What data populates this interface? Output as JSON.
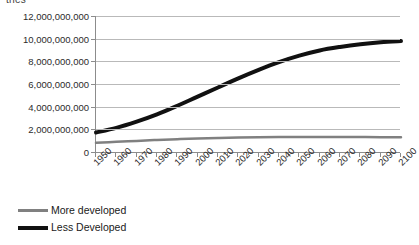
{
  "clipped_caption": "tries",
  "chart_data": {
    "type": "line",
    "title": "",
    "xlabel": "",
    "ylabel": "",
    "xlim": [
      1950,
      2100
    ],
    "ylim": [
      0,
      12000000000
    ],
    "grid": true,
    "legend_position": "bottom-left",
    "x": [
      1950,
      1960,
      1970,
      1980,
      1990,
      2000,
      2010,
      2020,
      2030,
      2040,
      2050,
      2060,
      2070,
      2080,
      2090,
      2100
    ],
    "xtick_labels": [
      "1950",
      "1960",
      "1970",
      "1980",
      "1990",
      "2000",
      "2010",
      "2020",
      "2030",
      "2040",
      "2050",
      "2060",
      "2070",
      "2080",
      "2090",
      "2100"
    ],
    "ytick_labels": [
      "0",
      "2,000,000,000",
      "4,000,000,000",
      "6,000,000,000",
      "8,000,000,000",
      "10,000,000,000",
      "12,000,000,000"
    ],
    "ytick_values": [
      0,
      2000000000,
      4000000000,
      6000000000,
      8000000000,
      10000000000,
      12000000000
    ],
    "series": [
      {
        "name": "More developed",
        "color": "#808080",
        "width": 2.5,
        "values": [
          810000000,
          900000000,
          980000000,
          1060000000,
          1130000000,
          1190000000,
          1230000000,
          1270000000,
          1300000000,
          1320000000,
          1330000000,
          1330000000,
          1330000000,
          1320000000,
          1310000000,
          1300000000
        ]
      },
      {
        "name": "Less Developed",
        "color": "#111111",
        "width": 4,
        "values": [
          1720000000,
          2130000000,
          2680000000,
          3320000000,
          4080000000,
          4890000000,
          5690000000,
          6500000000,
          7250000000,
          7930000000,
          8500000000,
          8960000000,
          9270000000,
          9510000000,
          9680000000,
          9790000000
        ]
      }
    ]
  },
  "legend": {
    "items": [
      {
        "label": "More developed",
        "color": "#808080"
      },
      {
        "label": "Less Developed",
        "color": "#111111"
      }
    ]
  }
}
